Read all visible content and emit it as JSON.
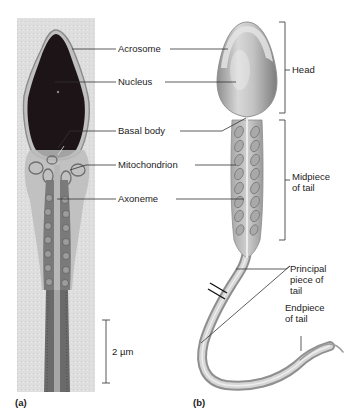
{
  "figure": {
    "panels": [
      {
        "id": "a",
        "label": "(a)",
        "kind": "electron micrograph"
      },
      {
        "id": "b",
        "label": "(b)",
        "kind": "illustration"
      }
    ],
    "micrograph_labels": {
      "acrosome": "Acrosome",
      "nucleus": "Nucleus",
      "basal_body": "Basal body",
      "mitochondrion": "Mitochondrion",
      "axoneme": "Axoneme"
    },
    "region_brackets": {
      "head": "Head",
      "midpiece_line1": "Midpiece",
      "midpiece_line2": "of tail"
    },
    "tail_labels": {
      "principal_line1": "Principal",
      "principal_line2": "piece of",
      "principal_line3": "tail",
      "endpiece_line1": "Endpiece",
      "endpiece_line2": "of tail"
    },
    "scale_bar": {
      "label": "2 µm"
    },
    "colors": {
      "micrograph_bg": "#dcdcdc",
      "nucleus_dark": "#1c1416",
      "drawing_grey": "#b9b9b9",
      "leader_line": "#333333"
    }
  }
}
